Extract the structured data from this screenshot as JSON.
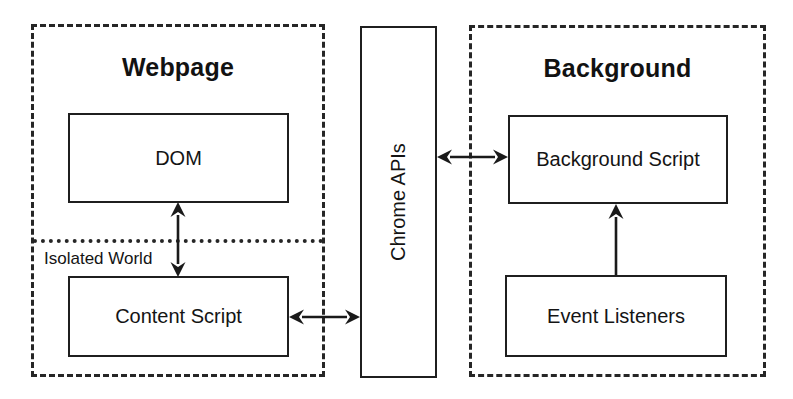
{
  "diagram": {
    "regions": [
      {
        "id": "webpage",
        "label": "Webpage",
        "x": 31,
        "y": 24,
        "w": 294,
        "h": 353
      },
      {
        "id": "background",
        "label": "Background",
        "x": 469,
        "y": 25,
        "w": 297,
        "h": 352
      }
    ],
    "nodes": [
      {
        "id": "dom",
        "label": "DOM",
        "x": 68,
        "y": 113,
        "w": 221,
        "h": 90,
        "orientation": "horizontal"
      },
      {
        "id": "content-script",
        "label": "Content Script",
        "x": 68,
        "y": 276,
        "w": 221,
        "h": 81,
        "orientation": "horizontal"
      },
      {
        "id": "chrome-apis",
        "label": "Chrome APIs",
        "x": 360,
        "y": 26,
        "w": 77,
        "h": 352,
        "orientation": "vertical"
      },
      {
        "id": "background-script",
        "label": "Background Script",
        "x": 508,
        "y": 115,
        "w": 220,
        "h": 89,
        "orientation": "horizontal"
      },
      {
        "id": "event-listeners",
        "label": "Event Listeners",
        "x": 505,
        "y": 275,
        "w": 222,
        "h": 82,
        "orientation": "horizontal"
      }
    ],
    "separator": {
      "id": "isolated-world",
      "label": "Isolated World",
      "x": 33,
      "y": 239,
      "w": 290,
      "label_x": 44,
      "label_y": 249
    },
    "connectors": [
      {
        "id": "dom-content-script",
        "from": "dom",
        "to": "content-script",
        "direction": "bidirectional",
        "axis": "vertical",
        "x": 178,
        "y1": 202,
        "y2": 277
      },
      {
        "id": "content-script-chrome-apis",
        "from": "content-script",
        "to": "chrome-apis",
        "direction": "bidirectional",
        "axis": "horizontal",
        "y": 317,
        "x1": 289,
        "x2": 360
      },
      {
        "id": "chrome-apis-background-script",
        "from": "chrome-apis",
        "to": "background-script",
        "direction": "bidirectional",
        "axis": "horizontal",
        "y": 157,
        "x1": 437,
        "x2": 508
      },
      {
        "id": "event-listeners-background-script",
        "from": "event-listeners",
        "to": "background-script",
        "direction": "up",
        "axis": "vertical",
        "x": 616,
        "y1": 275,
        "y2": 204
      }
    ],
    "colors": {
      "stroke": "#1a1a1a",
      "dashed_stroke": "#262626",
      "text": "#141414",
      "background": "#ffffff"
    }
  }
}
